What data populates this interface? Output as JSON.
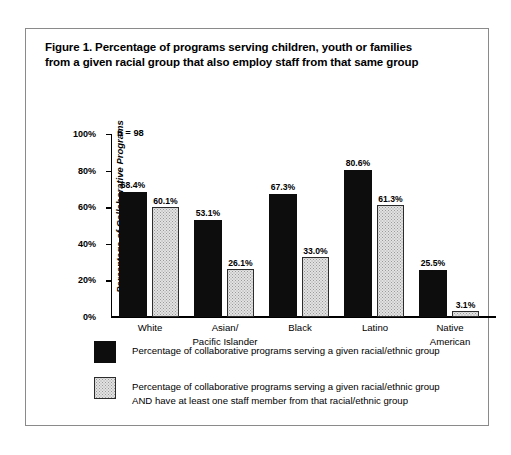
{
  "figure": {
    "title_line_1": "Figure 1. Percentage of programs serving children, youth or families",
    "title_line_2": "from a given racial group that also employ staff from that same group",
    "sample_note": "n = 98"
  },
  "legend": {
    "entries": [
      {
        "swatch": "black-solid-swatch",
        "line_1": "Percentage of collaborative programs serving a given racial/ethnic group",
        "line_2": ""
      },
      {
        "swatch": "light-stippled-swatch",
        "line_1": "Percentage of collaborative programs serving a given racial/ethnic group",
        "line_2": "AND have at least one staff member from that racial/ethnic group"
      }
    ]
  },
  "axis": {
    "y_title": "Percentage of Collaborative Programs",
    "y_ticks": [
      "100%",
      "80%",
      "60%",
      "40%",
      "20%",
      "0%"
    ],
    "x_labels": [
      {
        "line_1": "White",
        "line_2": ""
      },
      {
        "line_1": "Asian/",
        "line_2": "Pacific Islander"
      },
      {
        "line_1": "Black",
        "line_2": ""
      },
      {
        "line_1": "Latino",
        "line_2": ""
      },
      {
        "line_1": "Native",
        "line_2": "American"
      }
    ]
  },
  "values": {
    "served": [
      "68.4%",
      "53.1%",
      "67.3%",
      "80.6%",
      "25.5%"
    ],
    "served_and_staff": [
      "60.1%",
      "26.1%",
      "33.0%",
      "61.3%",
      "3.1%"
    ]
  },
  "colors": {
    "series_dark": "#0d0d0d",
    "series_light": "#e2e2e2",
    "axis": "#000000",
    "frame": "#8a8a8a",
    "background": "#ffffff"
  },
  "chart_data": {
    "type": "bar",
    "title": "Figure 1. Percentage of programs serving children, youth or families from a given racial group that also employ staff from that same group",
    "xlabel": "",
    "ylabel": "Percentage of Collaborative Programs",
    "ylim": [
      0,
      100
    ],
    "ytick_values": [
      0,
      20,
      40,
      60,
      80,
      100
    ],
    "ytick_labels": [
      "0%",
      "20%",
      "40%",
      "60%",
      "80%",
      "100%"
    ],
    "grid": false,
    "legend_position": "below-plot",
    "annotations": [
      "n = 98"
    ],
    "categories": [
      "White",
      "Asian/Pacific Islander",
      "Black",
      "Latino",
      "Native American"
    ],
    "series": [
      {
        "name": "Percentage of collaborative programs serving a given racial/ethnic group",
        "values": [
          68.4,
          53.1,
          67.3,
          80.6,
          25.5
        ]
      },
      {
        "name": "Percentage of collaborative programs serving a given racial/ethnic group AND have at least one staff member from that racial/ethnic group",
        "values": [
          60.1,
          26.1,
          33.0,
          61.3,
          3.1
        ]
      }
    ]
  }
}
